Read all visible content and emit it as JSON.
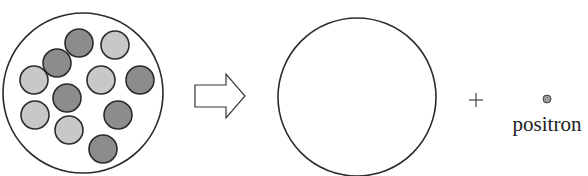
{
  "diagram": {
    "type": "nuclear-decay-schematic",
    "nucleus_before": {
      "outline": {
        "cx": 83,
        "cy": 93,
        "r": 80
      },
      "particles": [
        {
          "kind": "neutron",
          "cx": 79,
          "cy": 43
        },
        {
          "kind": "proton",
          "cx": 115,
          "cy": 45
        },
        {
          "kind": "neutron",
          "cx": 57,
          "cy": 63
        },
        {
          "kind": "proton",
          "cx": 34,
          "cy": 80
        },
        {
          "kind": "proton",
          "cx": 101,
          "cy": 80
        },
        {
          "kind": "neutron",
          "cx": 140,
          "cy": 80
        },
        {
          "kind": "neutron",
          "cx": 67,
          "cy": 98
        },
        {
          "kind": "proton",
          "cx": 35,
          "cy": 115
        },
        {
          "kind": "neutron",
          "cx": 118,
          "cy": 115
        },
        {
          "kind": "proton",
          "cx": 69,
          "cy": 130
        },
        {
          "kind": "neutron",
          "cx": 103,
          "cy": 149
        }
      ],
      "particle_radius": 14
    },
    "arrow": {
      "direction": "right",
      "icon": "hollow-arrow-right"
    },
    "nucleus_after": {
      "outline": {
        "cx": 357,
        "cy": 97,
        "r": 79
      }
    },
    "operator": "+",
    "emitted_particle": {
      "label": "positron",
      "cx": 547,
      "cy": 99,
      "r": 4
    }
  },
  "colors": {
    "proton_fill": "#c8c8c8",
    "neutron_fill": "#8c8c8c",
    "stroke": "#2b2b2b",
    "positron_fill": "#9a9a9a"
  }
}
